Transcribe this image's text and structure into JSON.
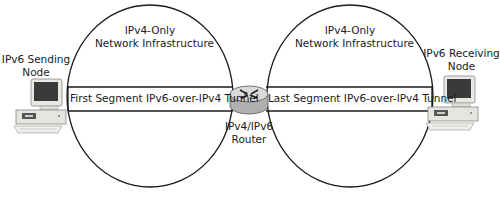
{
  "diagram": {
    "type": "network-topology",
    "nodes": {
      "sender": {
        "label_line1": "IPv6 Sending",
        "label_line2": "Node",
        "icon": "desktop-computer-icon"
      },
      "receiver": {
        "label_line1": "IPv6 Receiving",
        "label_line2": "Node",
        "icon": "desktop-computer-icon"
      },
      "router": {
        "label_line1": "IPv4/IPv6",
        "label_line2": "Router",
        "icon": "router-icon"
      }
    },
    "networks": [
      {
        "id": "left",
        "label_line1": "IPv4-Only",
        "label_line2": "Network Infrastructure"
      },
      {
        "id": "right",
        "label_line1": "IPv4-Only",
        "label_line2": "Network Infrastructure"
      }
    ],
    "tunnels": [
      {
        "id": "first",
        "label": "First Segment IPv6-over-IPv4 Tunnel"
      },
      {
        "id": "last",
        "label": "Last Segment IPv6-over-IPv4 Tunnel"
      }
    ],
    "edges": [
      {
        "from": "sender",
        "to": "router",
        "via": "first"
      },
      {
        "from": "router",
        "to": "receiver",
        "via": "last"
      }
    ],
    "colors": {
      "stroke": "#1a1a1a",
      "router_body": "#b8b8b8",
      "router_top": "#d8d8d8",
      "monitor_screen": "#3a3a3a",
      "computer_case": "#e6e6e0"
    }
  }
}
